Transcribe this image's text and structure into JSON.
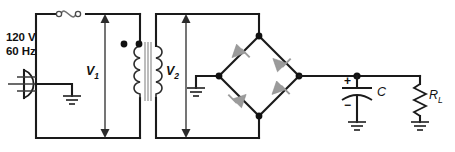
{
  "figure": {
    "type": "circuit-schematic",
    "width": 455,
    "height": 152,
    "background_color": "#ffffff",
    "wire_color": "#1a1a1a",
    "diode_fill_color": "#9b9b9b",
    "core_color": "#9a9a9a"
  },
  "labels": {
    "source_voltage": "120 V",
    "source_frequency": "60 Hz",
    "primary_voltage": "V",
    "primary_voltage_sub": "1",
    "secondary_voltage": "V",
    "secondary_voltage_sub": "2",
    "capacitor": "C",
    "capacitor_plus": "+",
    "capacitor_minus": "−",
    "load_resistor": "R",
    "load_resistor_sub": "L"
  },
  "components": [
    {
      "id": "ac-plug",
      "name": "ac-plug-symbol",
      "label": "120 V 60 Hz",
      "type": "ac-mains-plug"
    },
    {
      "id": "fuse",
      "name": "fuse-symbol",
      "label": "",
      "type": "fuse"
    },
    {
      "id": "transformer",
      "name": "transformer-symbol",
      "label": "",
      "type": "iron-core-transformer",
      "polarity_dots": 2
    },
    {
      "id": "diode-1",
      "name": "diode-top-left",
      "label": "",
      "type": "diode",
      "orientation": "points-up-right"
    },
    {
      "id": "diode-2",
      "name": "diode-top-right",
      "label": "",
      "type": "diode",
      "orientation": "points-down-right"
    },
    {
      "id": "diode-3",
      "name": "diode-bottom-left",
      "label": "",
      "type": "diode",
      "orientation": "points-up-left"
    },
    {
      "id": "diode-4",
      "name": "diode-bottom-right",
      "label": "",
      "type": "diode",
      "orientation": "points-up-right"
    },
    {
      "id": "capacitor",
      "name": "filter-capacitor",
      "label": "C",
      "type": "polarized-capacitor"
    },
    {
      "id": "load",
      "name": "load-resistor",
      "label": "RL",
      "type": "resistor"
    },
    {
      "id": "ground-primary",
      "name": "ground-primary",
      "label": "",
      "type": "ground"
    },
    {
      "id": "ground-secondary",
      "name": "ground-secondary",
      "label": "",
      "type": "ground"
    },
    {
      "id": "ground-capacitor",
      "name": "ground-capacitor",
      "label": "",
      "type": "ground"
    },
    {
      "id": "ground-load",
      "name": "ground-load",
      "label": "",
      "type": "ground"
    }
  ],
  "measurements": [
    {
      "id": "v1",
      "name": "primary-voltage-arrow",
      "label": "V1",
      "description": "double-headed vertical arrow across transformer primary"
    },
    {
      "id": "v2",
      "name": "secondary-voltage-arrow",
      "label": "V2",
      "description": "double-headed vertical arrow across transformer secondary"
    }
  ]
}
